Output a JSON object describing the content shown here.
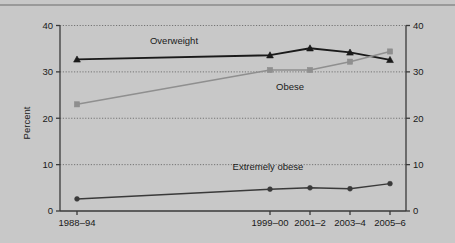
{
  "chart_data": {
    "type": "line",
    "title": "",
    "xlabel": "",
    "ylabel": "Percent",
    "ylabel_right": "",
    "categories": [
      "1988–94",
      "1999–00",
      "2001–2",
      "2003–4",
      "2005–6"
    ],
    "ylim": [
      0,
      40
    ],
    "yticks": [
      0,
      10,
      20,
      30,
      40
    ],
    "ylim_right": [
      0,
      40
    ],
    "yticks_right": [
      0,
      10,
      20,
      30,
      40
    ],
    "grid": true,
    "legend": "inline-annotations",
    "series": [
      {
        "name": "Overweight",
        "color": "#1a1a1a",
        "marker": "triangle",
        "values": [
          32.7,
          33.6,
          35.1,
          34.2,
          32.6
        ]
      },
      {
        "name": "Obese",
        "color": "#8f8f8f",
        "marker": "square",
        "values": [
          23.0,
          30.4,
          30.4,
          32.2,
          34.4
        ]
      },
      {
        "name": "Extremely obese",
        "color": "#3a3a3a",
        "marker": "circle",
        "values": [
          2.6,
          4.7,
          5.0,
          4.8,
          5.9
        ]
      }
    ],
    "annotations": [
      {
        "text": "Overweight",
        "x_px": 174,
        "y_px": 44
      },
      {
        "text": "Obese",
        "x_px": 290,
        "y_px": 90
      },
      {
        "text": "Extremely obese",
        "x_px": 268,
        "y_px": 170
      }
    ],
    "ytick_labels_left": [
      "0",
      "10",
      "20",
      "30",
      "40"
    ],
    "ytick_labels_right": [
      "0",
      "10",
      "20",
      "30",
      "40"
    ]
  },
  "colors": {
    "background": "#c8c8c8",
    "axis": "#3a3a3a",
    "grid": "#6b6b6b",
    "overweight": "#1a1a1a",
    "obese": "#8f8f8f",
    "extremely_obese": "#3a3a3a"
  }
}
